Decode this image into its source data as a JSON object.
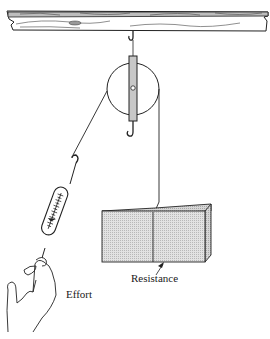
{
  "diagram": {
    "type": "single fixed pulley with spring scale",
    "labels": {
      "resistance": "Resistance",
      "effort": "Effort"
    },
    "parts": [
      "ceiling-beam",
      "hook",
      "pulley",
      "rope",
      "spring-scale",
      "hand",
      "block"
    ]
  }
}
